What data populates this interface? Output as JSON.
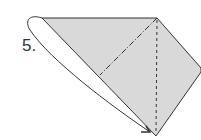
{
  "diagram": {
    "type": "origami-instruction",
    "step_label": "5.",
    "colors": {
      "paper": "#d9d9d9",
      "line": "#333333",
      "background": "#ffffff"
    },
    "lines": [
      {
        "name": "valley-fold-line",
        "style": "dash-dot"
      },
      {
        "name": "center-crease",
        "style": "dashed"
      }
    ],
    "arrow": {
      "name": "fold-arrow",
      "direction": "left-flap to bottom point"
    }
  }
}
